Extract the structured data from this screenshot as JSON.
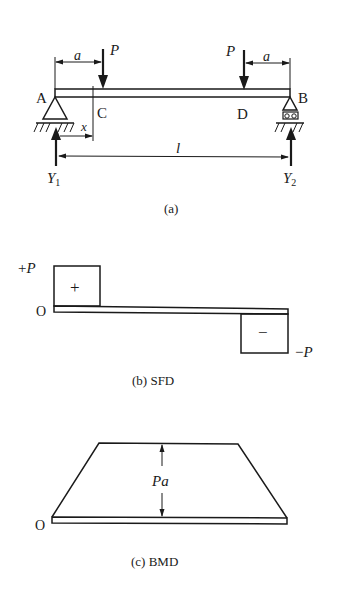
{
  "figure_a": {
    "caption": "(a)",
    "points": {
      "A": "A",
      "B": "B",
      "C": "C",
      "D": "D"
    },
    "loads": [
      {
        "label": "P",
        "at": "C"
      },
      {
        "label": "P",
        "at": "D"
      }
    ],
    "dimensions": {
      "a_left": "a",
      "a_right": "a",
      "x": "x",
      "l": "l"
    },
    "reactions": [
      {
        "label": "Y",
        "sub": "1"
      },
      {
        "label": "Y",
        "sub": "2"
      }
    ]
  },
  "figure_b": {
    "caption": "(b) SFD",
    "plus_label": "+P",
    "minus_label": "−P",
    "origin_label": "O",
    "plus_sign": "+",
    "minus_sign": "−"
  },
  "figure_c": {
    "caption": "(c) BMD",
    "origin_label": "O",
    "value_label": "Pa"
  },
  "colors": {
    "ink": "#1a1a1a",
    "background": "#ffffff"
  }
}
